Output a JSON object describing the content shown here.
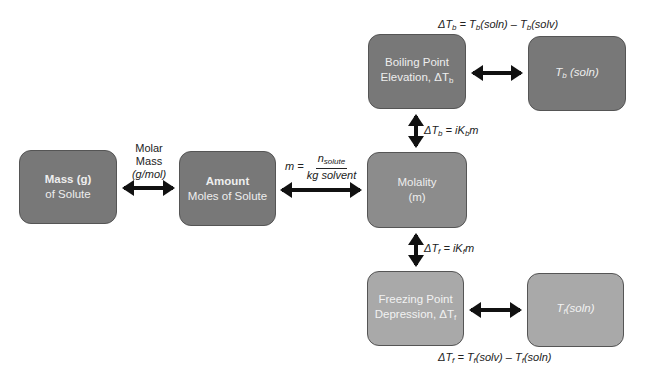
{
  "nodes": {
    "mass": {
      "line1": "Mass (g)",
      "line2": "of Solute"
    },
    "amount": {
      "line1": "Amount",
      "line2": "Moles of Solute"
    },
    "molality": {
      "line1": "Molality",
      "line2": "(m)"
    },
    "boiling": {
      "line1": "Boiling Point",
      "line2": "Elevation, ΔT",
      "sub": "b"
    },
    "tb_soln": {
      "main": "T",
      "sub": "b",
      "rest": " (soln)"
    },
    "freezing": {
      "line1": "Freezing Point",
      "line2": "Depression, ΔT",
      "sub": "f"
    },
    "tf_soln": {
      "main": "T",
      "sub": "f",
      "rest": "(soln)"
    }
  },
  "edges": {
    "mass_amount": {
      "l1": "Molar",
      "l2": "Mass",
      "l3": "(g/mol)"
    },
    "amount_molality": {
      "lhs": "m = ",
      "num": "n",
      "num_sub": "solute",
      "den": "kg solvent"
    },
    "molality_boiling": {
      "a": "ΔT",
      "a_sub": "b",
      "b": " = iK",
      "b_sub": "b",
      "c": "m"
    },
    "molality_freezing": {
      "a": "ΔT",
      "a_sub": "f",
      "b": " = iK",
      "b_sub": "f",
      "c": "m"
    },
    "boiling_def": {
      "a": "ΔT",
      "a_sub": "b",
      "b": " = T",
      "b_sub": "b",
      "c": "(soln) – T",
      "c_sub": "b",
      "d": "(solv)"
    },
    "freezing_def": {
      "a": "ΔT",
      "a_sub": "f",
      "b": " = T",
      "b_sub": "f",
      "c": "(solv) – T",
      "c_sub": "f",
      "d": "(soln)"
    }
  }
}
